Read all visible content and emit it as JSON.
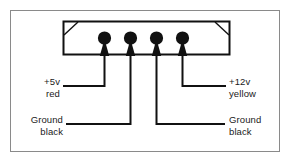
{
  "figure": {
    "background_color": "#ffffff",
    "frame_color": "#8a8a8a",
    "line_color": "#1a1a1a"
  },
  "connector": {
    "name": "power-connector-housing",
    "pin_count": 4,
    "pins": [
      {
        "index": 1,
        "label_primary": "+5v",
        "label_secondary": "red"
      },
      {
        "index": 2,
        "label_primary": "Ground",
        "label_secondary": "black"
      },
      {
        "index": 3,
        "label_primary": "Ground",
        "label_secondary": "black"
      },
      {
        "index": 4,
        "label_primary": "+12v",
        "label_secondary": "yellow"
      }
    ]
  },
  "labels": {
    "five_volt": {
      "line1": "+5v",
      "line2": "red"
    },
    "twelve_volt": {
      "line1": "+12v",
      "line2": "yellow"
    },
    "ground_left": {
      "line1": "Ground",
      "line2": "black"
    },
    "ground_right": {
      "line1": "Ground",
      "line2": "black"
    }
  }
}
